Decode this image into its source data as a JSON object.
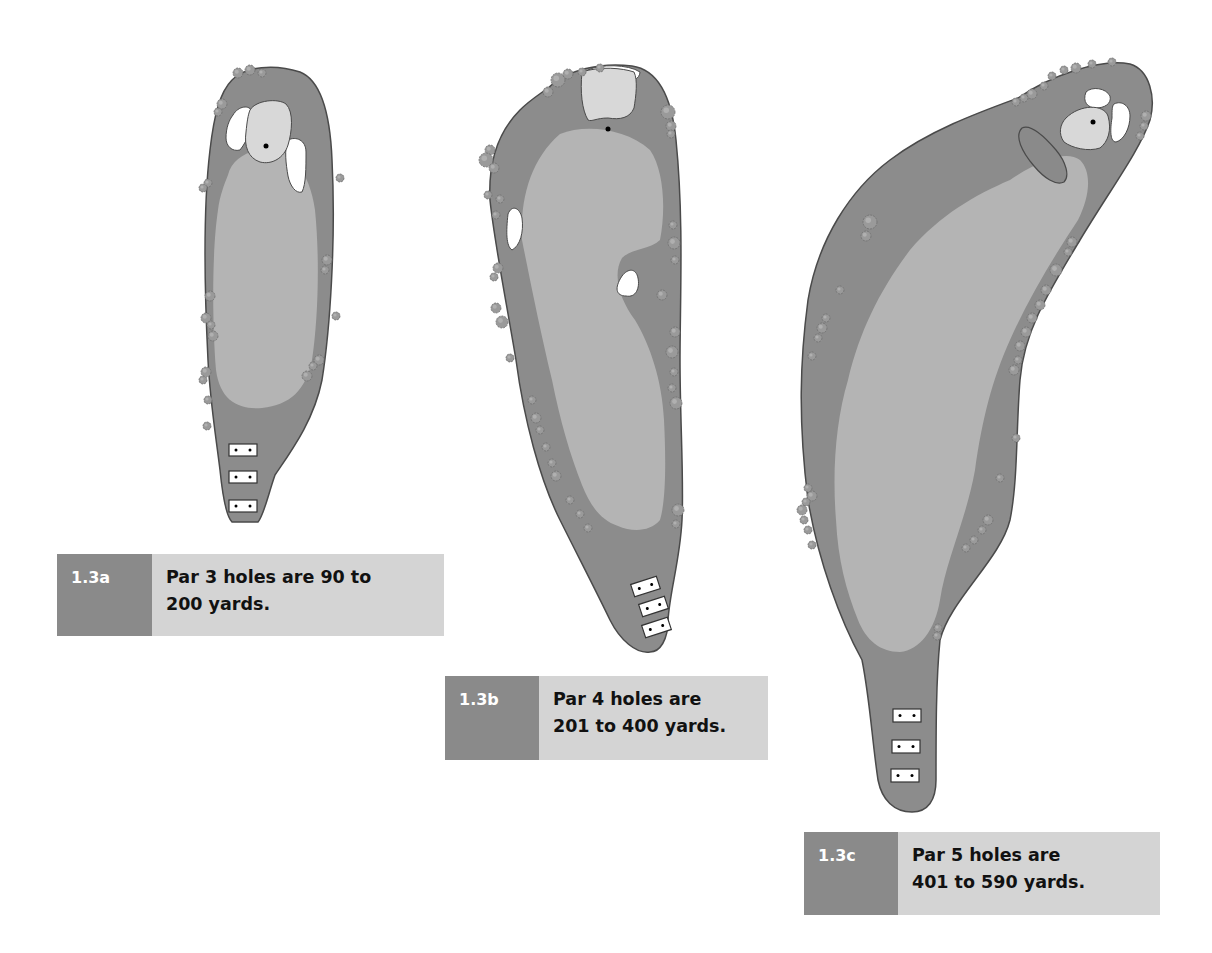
{
  "colors": {
    "rough": "#8c8c8c",
    "fairway": "#b4b4b4",
    "green": "#d8d8d8",
    "bunker": "#ffffff",
    "water": "#8a8a8a",
    "tree": "#9a9a9a",
    "outline": "#4a4a4a",
    "label_bg": "#8a8a8a",
    "text_bg": "#d4d4d4"
  },
  "holes": [
    {
      "id": "1.3a",
      "par": 3,
      "rough_path": "M232 80 C245 66 275 64 300 72 C320 80 330 110 332 160 C336 240 330 330 322 380 C314 420 292 450 275 475 C268 495 264 515 258 522 L232 522 C225 515 222 490 220 470 C215 430 210 400 208 360 C204 280 204 200 210 150 C214 115 220 92 232 80 Z",
      "fairway_path": "M228 175 C232 158 250 150 268 148 C290 148 310 172 315 210 C320 260 318 320 312 360 C306 390 290 405 262 408 C238 410 220 400 216 370 C212 320 212 250 218 210 C220 195 224 185 228 175 Z",
      "green_path": "M250 110 C256 100 278 98 286 104 C294 112 292 132 288 145 C284 158 272 165 260 162 C248 158 244 146 246 132 C247 122 248 115 250 110 Z",
      "bunkers": [
        "M233 115 C238 106 250 104 252 112 C254 124 248 140 240 150 C232 152 226 146 226 138 C226 128 229 120 233 115 Z",
        "M288 140 C296 136 306 140 306 152 C306 168 306 184 302 192 C296 194 290 186 288 176 C286 164 284 150 288 140 Z"
      ],
      "pin": [
        266,
        146
      ],
      "tees": [
        {
          "x": 229,
          "y": 444,
          "w": 28,
          "h": 12,
          "rot": 0
        },
        {
          "x": 229,
          "y": 471,
          "w": 28,
          "h": 12,
          "rot": 0
        },
        {
          "x": 229,
          "y": 500,
          "w": 28,
          "h": 12,
          "rot": 0
        }
      ],
      "trees": [
        [
          238,
          73,
          5
        ],
        [
          250,
          70,
          5
        ],
        [
          262,
          73,
          4
        ],
        [
          222,
          104,
          5
        ],
        [
          218,
          112,
          4
        ],
        [
          208,
          183,
          4
        ],
        [
          203,
          188,
          4
        ],
        [
          210,
          296,
          5
        ],
        [
          206,
          318,
          5
        ],
        [
          211,
          325,
          4
        ],
        [
          213,
          336,
          5
        ],
        [
          206,
          372,
          5
        ],
        [
          203,
          380,
          4
        ],
        [
          208,
          400,
          4
        ],
        [
          340,
          178,
          4
        ],
        [
          327,
          260,
          5
        ],
        [
          325,
          270,
          4
        ],
        [
          336,
          316,
          4
        ],
        [
          319,
          360,
          5
        ],
        [
          313,
          366,
          4
        ],
        [
          307,
          376,
          5
        ],
        [
          207,
          426,
          4
        ]
      ],
      "caption": {
        "label": "1.3a",
        "line1": "Par 3 holes are 90 to",
        "line2": "200 yards.",
        "x": 57,
        "y": 554,
        "label_w": 95,
        "text_w": 292,
        "h": 82
      }
    },
    {
      "id": "1.3b",
      "par": 4,
      "rough_path": "M548 88 C566 70 600 62 632 66 C660 70 672 100 676 140 C684 220 680 300 680 360 C680 420 684 480 682 520 C680 560 670 590 668 620 C668 640 660 652 650 652 C636 654 620 640 610 620 C598 595 580 560 560 520 C540 480 524 420 516 360 C506 300 494 240 490 200 C488 160 500 130 520 110 C530 100 540 94 548 88 Z",
      "fairway_path": "M560 134 C585 124 625 128 650 150 C664 170 666 210 660 240 C650 250 632 248 622 258 C612 275 620 300 635 320 C650 345 662 380 664 420 C666 460 666 500 660 520 C650 532 632 532 618 526 C600 520 590 505 582 485 C570 455 560 420 552 380 C540 330 530 280 522 240 C520 200 530 160 560 134 Z",
      "green_path": "M582 72 C600 66 622 68 634 72 C638 80 636 96 634 108 C630 118 620 120 608 118 C596 118 592 122 588 120 C582 110 580 92 582 72 Z",
      "bunkers": [
        "M588 70 C600 64 628 64 640 72 C640 78 632 84 620 84 C606 82 594 80 588 76 Z",
        "M508 214 C512 204 520 208 522 218 C524 232 520 246 512 250 C506 246 506 232 508 214 Z",
        "M622 276 C628 268 636 268 638 278 C640 288 636 298 626 296 C616 296 614 288 622 276 Z"
      ],
      "pin": [
        608,
        129
      ],
      "tees": [
        {
          "x": 632,
          "y": 580,
          "w": 27,
          "h": 13,
          "rot": -18
        },
        {
          "x": 640,
          "y": 600,
          "w": 27,
          "h": 13,
          "rot": -18
        },
        {
          "x": 643,
          "y": 621,
          "w": 27,
          "h": 13,
          "rot": -18
        }
      ],
      "trees": [
        [
          548,
          92,
          5
        ],
        [
          558,
          80,
          7
        ],
        [
          568,
          74,
          5
        ],
        [
          582,
          72,
          4
        ],
        [
          600,
          68,
          4
        ],
        [
          668,
          112,
          7
        ],
        [
          671,
          126,
          5
        ],
        [
          671,
          134,
          4
        ],
        [
          490,
          150,
          5
        ],
        [
          486,
          160,
          7
        ],
        [
          494,
          168,
          5
        ],
        [
          488,
          195,
          4
        ],
        [
          500,
          199,
          4
        ],
        [
          496,
          215,
          4
        ],
        [
          673,
          225,
          4
        ],
        [
          674,
          243,
          6
        ],
        [
          675,
          260,
          4
        ],
        [
          498,
          268,
          5
        ],
        [
          494,
          277,
          4
        ],
        [
          662,
          295,
          5
        ],
        [
          496,
          308,
          5
        ],
        [
          502,
          322,
          6
        ],
        [
          510,
          358,
          4
        ],
        [
          675,
          332,
          5
        ],
        [
          672,
          352,
          6
        ],
        [
          674,
          372,
          4
        ],
        [
          672,
          388,
          4
        ],
        [
          676,
          403,
          6
        ],
        [
          532,
          400,
          4
        ],
        [
          536,
          418,
          5
        ],
        [
          540,
          430,
          4
        ],
        [
          546,
          447,
          4
        ],
        [
          552,
          463,
          4
        ],
        [
          556,
          476,
          5
        ],
        [
          570,
          500,
          4
        ],
        [
          580,
          514,
          4
        ],
        [
          588,
          528,
          4
        ],
        [
          678,
          510,
          6
        ],
        [
          676,
          524,
          4
        ]
      ],
      "caption": {
        "label": "1.3b",
        "line1": "Par 4 holes are",
        "line2": "201 to 400 yards.",
        "x": 445,
        "y": 676,
        "label_w": 94,
        "text_w": 229,
        "h": 84
      }
    },
    {
      "id": "1.3c",
      "par": 5,
      "rough_path": "M1018 98 C1050 76 1100 58 1130 64 C1150 70 1156 98 1150 120 C1140 150 1110 190 1080 240 C1050 290 1024 330 1020 380 C1016 430 1018 480 1010 520 C1000 560 950 600 940 640 C936 680 936 730 936 780 C936 800 928 812 912 812 C894 812 882 800 878 780 C872 740 870 700 862 660 C840 620 818 560 808 500 C798 420 800 360 808 300 C818 240 850 190 890 160 C930 130 980 112 1018 98 Z",
      "fairway_path": "M1010 180 C1040 160 1066 150 1080 160 C1092 172 1090 196 1078 220 C1055 255 1030 295 1010 340 C992 380 982 420 975 470 C966 520 946 560 940 600 C935 630 920 650 900 652 C880 652 866 640 858 620 C846 590 838 560 836 520 C832 470 836 420 848 380 C860 330 880 290 910 250 C940 215 975 195 1010 180 Z",
      "green_path": "M1066 118 C1080 104 1104 104 1108 116 C1112 130 1108 142 1100 148 C1088 152 1072 148 1064 142 C1058 134 1060 124 1066 118 Z",
      "water_path": "M1022 128 C1030 124 1044 136 1056 150 C1066 162 1070 176 1064 182 C1056 186 1044 178 1034 166 C1022 152 1014 136 1022 128 Z",
      "bunkers": [
        "M1086 92 C1092 86 1106 88 1110 96 C1112 104 1104 108 1096 108 C1088 108 1082 102 1086 92 Z",
        "M1114 104 C1122 100 1130 106 1130 116 C1130 128 1124 140 1116 142 C1110 142 1110 130 1112 118 C1112 110 1112 106 1114 104 Z"
      ],
      "pin": [
        1093,
        122
      ],
      "tees": [
        {
          "x": 893,
          "y": 709,
          "w": 28,
          "h": 13,
          "rot": 0
        },
        {
          "x": 892,
          "y": 740,
          "w": 28,
          "h": 13,
          "rot": 0
        },
        {
          "x": 891,
          "y": 769,
          "w": 28,
          "h": 13,
          "rot": 0
        }
      ],
      "trees": [
        [
          1016,
          102,
          4
        ],
        [
          1024,
          98,
          4
        ],
        [
          1032,
          94,
          5
        ],
        [
          1044,
          86,
          4
        ],
        [
          1052,
          76,
          4
        ],
        [
          1064,
          70,
          4
        ],
        [
          1076,
          68,
          5
        ],
        [
          1092,
          64,
          4
        ],
        [
          1112,
          62,
          4
        ],
        [
          1146,
          116,
          5
        ],
        [
          1144,
          126,
          4
        ],
        [
          1140,
          136,
          4
        ],
        [
          870,
          222,
          7
        ],
        [
          866,
          236,
          5
        ],
        [
          840,
          290,
          4
        ],
        [
          826,
          318,
          4
        ],
        [
          822,
          328,
          5
        ],
        [
          818,
          338,
          4
        ],
        [
          812,
          356,
          4
        ],
        [
          1072,
          242,
          5
        ],
        [
          1068,
          252,
          4
        ],
        [
          1056,
          270,
          6
        ],
        [
          1046,
          290,
          5
        ],
        [
          1040,
          305,
          5
        ],
        [
          1032,
          318,
          5
        ],
        [
          1026,
          332,
          5
        ],
        [
          1020,
          346,
          5
        ],
        [
          1018,
          360,
          4
        ],
        [
          1014,
          370,
          5
        ],
        [
          808,
          488,
          4
        ],
        [
          812,
          496,
          5
        ],
        [
          806,
          502,
          4
        ],
        [
          802,
          510,
          5
        ],
        [
          804,
          520,
          4
        ],
        [
          808,
          530,
          4
        ],
        [
          812,
          545,
          4
        ],
        [
          1016,
          438,
          4
        ],
        [
          1000,
          478,
          4
        ],
        [
          988,
          520,
          5
        ],
        [
          982,
          530,
          4
        ],
        [
          974,
          540,
          4
        ],
        [
          966,
          548,
          4
        ],
        [
          938,
          628,
          4
        ],
        [
          937,
          636,
          4
        ]
      ],
      "caption": {
        "label": "1.3c",
        "line1": "Par 5 holes are",
        "line2": "401 to 590 yards.",
        "x": 804,
        "y": 832,
        "label_w": 94,
        "text_w": 262,
        "h": 83
      }
    }
  ]
}
